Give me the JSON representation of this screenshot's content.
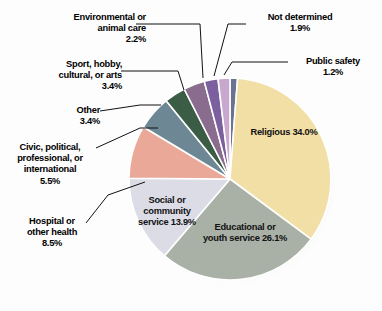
{
  "chart_data": {
    "type": "pie",
    "title": "",
    "subtitle": "",
    "xlabel": "",
    "ylabel": "",
    "legend_position": "none",
    "grid": false,
    "units": "percent",
    "total": 100.0,
    "start_angle_deg": 0,
    "direction": "clockwise",
    "categories": [
      "Public safety",
      "Religious",
      "Educational or youth service",
      "Social or community service",
      "Hospital or other health",
      "Civic, political, professional, or international",
      "Other",
      "Sport, hobby, cultural, or arts",
      "Environmental or animal care",
      "Not determined"
    ],
    "values": [
      1.2,
      34.0,
      26.1,
      13.9,
      8.5,
      5.5,
      3.4,
      3.4,
      2.2,
      1.9
    ],
    "colors": [
      "#6a7490",
      "#f1dfa6",
      "#a9b0a6",
      "#dcdce6",
      "#eaa898",
      "#6e8794",
      "#3b5d46",
      "#8a6d8e",
      "#7b5f9f",
      "#c9a8cf"
    ],
    "slice_labels": [
      {
        "name": "Religious",
        "pct": "34.0%"
      },
      {
        "name": "Educational or youth service",
        "pct": "26.1%"
      },
      {
        "name": "Social or community service",
        "pct": "13.9%"
      }
    ],
    "callouts": [
      {
        "name": "Environmental or animal care",
        "pct": "2.2%"
      },
      {
        "name": "Not determined",
        "pct": "1.9%"
      },
      {
        "name": "Public safety",
        "pct": "1.2%"
      },
      {
        "name": "Sport, hobby, cultural, or arts",
        "pct": "3.4%"
      },
      {
        "name": "Other",
        "pct": "3.4%"
      },
      {
        "name": "Civic, political, professional, or international",
        "pct": "5.5%"
      },
      {
        "name": "Hospital or other health",
        "pct": "8.5%"
      }
    ]
  },
  "labels": {
    "environmental": {
      "line1": "Environmental or",
      "line2": "animal care",
      "pct": "2.2%"
    },
    "sport": {
      "line1": "Sport, hobby,",
      "line2": "cultural, or arts",
      "pct": "3.4%"
    },
    "other": {
      "line1": "Other",
      "pct": "3.4%"
    },
    "civic": {
      "line1": "Civic, political,",
      "line2": "professional, or",
      "line3": "international",
      "pct": "5.5%"
    },
    "hospital": {
      "line1": "Hospital or",
      "line2": "other health",
      "pct": "8.5%"
    },
    "not_determined": {
      "line1": "Not determined",
      "pct": "1.9%"
    },
    "public_safety": {
      "line1": "Public safety",
      "pct": "1.2%"
    },
    "religious": {
      "line1": "Religious",
      "pct": "34.0%"
    },
    "educational": {
      "line1": "Educational or",
      "line2": "youth service",
      "pct": "26.1%"
    },
    "social": {
      "line1": "Social or",
      "line2": "community",
      "line3": "service",
      "pct": "13.9%"
    }
  }
}
